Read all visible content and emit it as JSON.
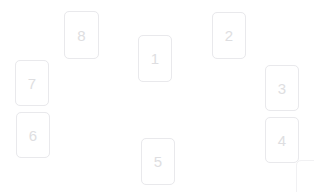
{
  "canvas": {
    "width": 314,
    "height": 192,
    "background_color": "#ffffff"
  },
  "style": {
    "card_border_color": "#e9e9ec",
    "card_background_color": "#ffffff",
    "card_label_color": "#dedee1",
    "card_corner_radius": 5
  },
  "cards": [
    {
      "label": "8",
      "name": "card-8",
      "x": 64,
      "y": 11,
      "width": 35,
      "height": 48
    },
    {
      "label": "7",
      "name": "card-7",
      "x": 15,
      "y": 60,
      "width": 34,
      "height": 46
    },
    {
      "label": "6",
      "name": "card-6",
      "x": 16,
      "y": 112,
      "width": 34,
      "height": 46
    },
    {
      "label": "1",
      "name": "card-1",
      "x": 138,
      "y": 35,
      "width": 34,
      "height": 47
    },
    {
      "label": "5",
      "name": "card-5",
      "x": 141,
      "y": 138,
      "width": 34,
      "height": 47
    },
    {
      "label": "2",
      "name": "card-2",
      "x": 212,
      "y": 12,
      "width": 34,
      "height": 47
    },
    {
      "label": "3",
      "name": "card-3",
      "x": 265,
      "y": 65,
      "width": 34,
      "height": 46
    },
    {
      "label": "4",
      "name": "card-4",
      "x": 265,
      "y": 117,
      "width": 34,
      "height": 46
    }
  ],
  "corner_fragment": {
    "name": "clipped-card-fragment",
    "x": 296,
    "y": 160,
    "width": 26,
    "height": 38
  }
}
